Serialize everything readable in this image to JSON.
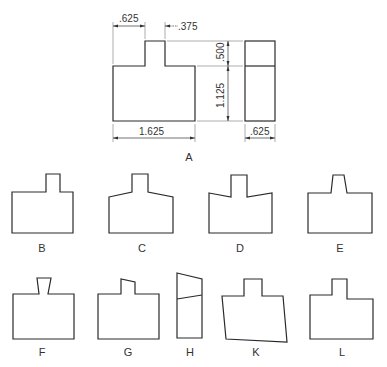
{
  "figure": {
    "main_label": "A",
    "dimensions": {
      "tab_offset": ".625",
      "tab_width": ".375",
      "tab_height": ".500",
      "body_height": "1.125",
      "total_width": "1.625",
      "depth": ".625"
    },
    "options": [
      {
        "id": "B",
        "label": "B"
      },
      {
        "id": "C",
        "label": "C"
      },
      {
        "id": "D",
        "label": "D"
      },
      {
        "id": "E",
        "label": "E"
      },
      {
        "id": "F",
        "label": "F"
      },
      {
        "id": "G",
        "label": "G"
      },
      {
        "id": "H",
        "label": "H"
      },
      {
        "id": "K",
        "label": "K"
      },
      {
        "id": "L",
        "label": "L"
      }
    ]
  }
}
